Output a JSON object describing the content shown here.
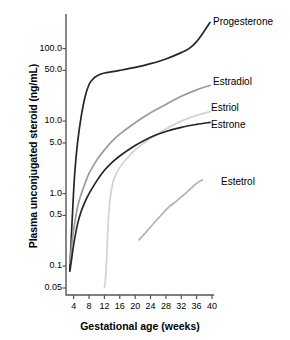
{
  "chart_data": {
    "type": "line",
    "title": "",
    "xlabel": "Gestational age (weeks)",
    "ylabel": "Plasma unconjugated steroid (ng/mL)",
    "yscale": "log",
    "ylim": [
      0.04,
      300
    ],
    "xlim": [
      2,
      40
    ],
    "grid": false,
    "legend_position": "inline-right",
    "x_ticks": [
      "4",
      "8",
      "12",
      "16",
      "20",
      "24",
      "28",
      "32",
      "36",
      "40"
    ],
    "x_tick_values": [
      4,
      8,
      12,
      16,
      20,
      24,
      28,
      32,
      36,
      40
    ],
    "y_ticks": [
      "100.0",
      "50.0",
      "10.0",
      "5.0",
      "1.0",
      "0.5",
      "0.1",
      "0.05"
    ],
    "y_tick_values": [
      100.0,
      50.0,
      10.0,
      5.0,
      1.0,
      0.5,
      0.1,
      0.05
    ],
    "series": [
      {
        "name": "Progesterone",
        "color": "#262626",
        "x": [
          3.0,
          3.3,
          3.8,
          4.3,
          5.0,
          6.0,
          7.0,
          8.0,
          9.0,
          10.0,
          12.0,
          14.0,
          16.0,
          20.0,
          24.0,
          28.0,
          32.0,
          34.0,
          36.0,
          38.0,
          39.5
        ],
        "y": [
          0.09,
          0.2,
          0.7,
          2.0,
          5.0,
          12.0,
          22.0,
          32.0,
          38.0,
          42.0,
          46.0,
          48.0,
          50.0,
          55.0,
          62.0,
          72.0,
          88.0,
          100.0,
          125.0,
          175.0,
          230.0
        ]
      },
      {
        "name": "Estradiol",
        "color": "#9a9a9a",
        "x": [
          3.0,
          3.5,
          4.0,
          5.0,
          6.0,
          7.0,
          8.0,
          10.0,
          12.0,
          14.0,
          16.0,
          20.0,
          24.0,
          28.0,
          32.0,
          36.0,
          39.5
        ],
        "y": [
          0.11,
          0.2,
          0.32,
          0.65,
          1.0,
          1.4,
          1.9,
          2.9,
          4.0,
          5.3,
          6.6,
          9.5,
          13.0,
          17.0,
          22.0,
          27.0,
          31.0
        ]
      },
      {
        "name": "Estriol",
        "color": "#d2d2d2",
        "x": [
          12.0,
          12.2,
          12.5,
          12.8,
          13.2,
          13.8,
          14.5,
          16.0,
          18.0,
          20.0,
          24.0,
          28.0,
          32.0,
          36.0,
          39.5
        ],
        "y": [
          0.051,
          0.06,
          0.1,
          0.25,
          0.6,
          1.1,
          1.6,
          2.3,
          3.1,
          4.0,
          5.8,
          7.8,
          10.0,
          12.0,
          13.5
        ]
      },
      {
        "name": "Estrone",
        "color": "#262626",
        "x": [
          3.0,
          3.5,
          4.0,
          5.0,
          6.0,
          7.0,
          8.0,
          10.0,
          12.0,
          14.0,
          16.0,
          20.0,
          24.0,
          28.0,
          32.0,
          36.0,
          39.5
        ],
        "y": [
          0.085,
          0.13,
          0.2,
          0.38,
          0.58,
          0.78,
          1.0,
          1.5,
          2.1,
          2.7,
          3.3,
          4.6,
          6.0,
          7.2,
          8.2,
          9.0,
          9.6
        ]
      },
      {
        "name": "Estetrol",
        "color": "#b0b0b0",
        "x": [
          21.0,
          23.0,
          25.0,
          27.0,
          29.0,
          30.5,
          32.0,
          33.5,
          35.0,
          36.5,
          37.5
        ],
        "y": [
          0.23,
          0.3,
          0.4,
          0.52,
          0.67,
          0.77,
          0.9,
          1.05,
          1.25,
          1.45,
          1.55
        ]
      }
    ],
    "series_labels": [
      {
        "name": "Progesterone",
        "x_px": 213,
        "y_px": 16
      },
      {
        "name": "Estradiol",
        "x_px": 213,
        "y_px": 76
      },
      {
        "name": "Estriol",
        "x_px": 211,
        "y_px": 102
      },
      {
        "name": "Estrone",
        "x_px": 211,
        "y_px": 119
      },
      {
        "name": "Estetrol",
        "x_px": 221,
        "y_px": 176
      }
    ]
  },
  "axes": {
    "frame_color": "#555555",
    "text_color": "#000000"
  }
}
